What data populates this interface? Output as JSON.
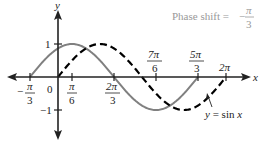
{
  "chart_data": {
    "type": "line",
    "title": "",
    "annotation": {
      "text": "Phase shift = −π/3",
      "prefix": "Phase shift =",
      "sign": "−",
      "num": "π",
      "den": "3"
    },
    "xlabel": "x",
    "ylabel": "y",
    "x_range_rad": [
      -0.4,
      2.35
    ],
    "ylim": [
      -1.2,
      1.6
    ],
    "x_ticks": [
      {
        "value": -1.0472,
        "label": "−π/3",
        "sign": "−",
        "num": "π",
        "den": "3"
      },
      {
        "value": 0,
        "label": "0"
      },
      {
        "value": 0.5236,
        "label": "π/6",
        "num": "π",
        "den": "6"
      },
      {
        "value": 2.0944,
        "label": "2π/3",
        "num": "2π",
        "den": "3"
      },
      {
        "value": 3.6652,
        "label": "7π/6",
        "num": "7π",
        "den": "6"
      },
      {
        "value": 5.236,
        "label": "5π/3",
        "num": "5π",
        "den": "3"
      },
      {
        "value": 6.2832,
        "label": "2π"
      }
    ],
    "y_ticks": [
      {
        "value": 1,
        "label": "1"
      },
      {
        "value": -1,
        "label": "−1"
      }
    ],
    "series": [
      {
        "name": "y = sin(x + π/3)",
        "style": "solid",
        "color": "#808080",
        "x": [
          -1.0472,
          -0.5236,
          0.5236,
          1.5708,
          2.0944,
          3.1416,
          3.6652,
          4.1888,
          5.236
        ],
        "y": [
          0,
          0.5,
          1,
          0.5,
          0,
          -0.866,
          -1,
          -0.866,
          0
        ]
      },
      {
        "name": "y = sin x",
        "style": "dashed",
        "color": "#000000",
        "x": [
          0,
          0.5236,
          1.5708,
          2.618,
          3.1416,
          4.1888,
          4.7124,
          5.7596,
          6.2832
        ],
        "y": [
          0,
          0.5,
          1,
          0.5,
          0,
          -0.866,
          -1,
          -0.5,
          0
        ]
      }
    ],
    "curve_label": "y = sin x",
    "legend": "none",
    "grid": false
  },
  "labels": {
    "x_axis": "x",
    "y_axis": "y",
    "zero": "0",
    "one": "1",
    "neg_one": "−1",
    "two_pi": "2π",
    "curve_label_y": "y",
    "curve_label_eq": " = sin ",
    "curve_label_x": "x"
  }
}
